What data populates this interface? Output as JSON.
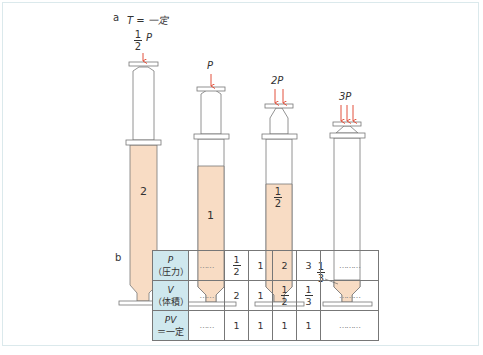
{
  "panel_a": {
    "label": "a",
    "condition": "T = 一定",
    "syringes": [
      {
        "pressure_num": "1",
        "pressure_den": "2",
        "pressure_var": "P",
        "volume": "2"
      },
      {
        "pressure": "P",
        "volume": "1"
      },
      {
        "pressure": "2P",
        "volume_num": "1",
        "volume_den": "2"
      },
      {
        "pressure": "3P",
        "volume_num": "1",
        "volume_den": "3"
      }
    ],
    "fill_color": "#f8dcc4",
    "arrow_color": "#e2503c"
  },
  "panel_b": {
    "label": "b",
    "rows": [
      {
        "header_var": "P",
        "header_jp": "（圧力）",
        "cells": [
          "……",
          "1/2",
          "1",
          "2",
          "3",
          "………"
        ]
      },
      {
        "header_var": "V",
        "header_jp": "（体積）",
        "cells": [
          "……",
          "2",
          "1",
          "1/2",
          "1/3",
          "………"
        ]
      },
      {
        "header_var": "PV",
        "header_jp": "＝一定",
        "cells": [
          "……",
          "1",
          "1",
          "1",
          "1",
          "………"
        ]
      }
    ],
    "frac_half_num": "1",
    "frac_half_den": "2",
    "frac_third_num": "1",
    "frac_third_den": "3",
    "header_color": "#cfe8ee"
  }
}
